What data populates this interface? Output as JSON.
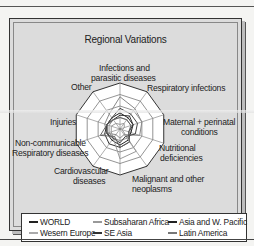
{
  "chart_data": {
    "type": "radar",
    "title": "Regional Variations",
    "axes": [
      "Infections and parasitic diseases",
      "Respiratory infections",
      "Maternal + perinatal conditions",
      "Nutritional deficiencies",
      "Malignant and other neoplasms",
      "Cardiovascular diseases",
      "Non-communicable Respiratory diseases",
      "Injuries",
      "Other"
    ],
    "grid_rings": 4,
    "grid": true,
    "legend_position": "bottom",
    "series": [
      {
        "name": "WORLD",
        "color": "#222222",
        "values": [
          0.35,
          0.3,
          0.3,
          0.25,
          0.3,
          0.35,
          0.3,
          0.3,
          0.3,
          0.3
        ],
        "values_are_estimates": true
      },
      {
        "name": "Subsaharan Africa",
        "color": "#888888",
        "values": [
          0.7,
          0.55,
          0.5,
          0.45,
          0.15,
          0.2,
          0.15,
          0.3,
          0.35,
          0.4
        ],
        "values_are_estimates": true
      },
      {
        "name": "Asia and W. Pacific",
        "color": "#333333",
        "values": [
          0.3,
          0.35,
          0.3,
          0.2,
          0.35,
          0.4,
          0.4,
          0.35,
          0.3,
          0.25
        ],
        "values_are_estimates": true
      },
      {
        "name": "Wesern Europe",
        "color": "#999999",
        "values": [
          0.1,
          0.15,
          0.1,
          0.05,
          0.6,
          0.65,
          0.25,
          0.2,
          0.2,
          0.15
        ],
        "values_are_estimates": true
      },
      {
        "name": "SE Asia",
        "color": "#444444",
        "values": [
          0.45,
          0.4,
          0.4,
          0.35,
          0.2,
          0.3,
          0.25,
          0.3,
          0.3,
          0.3
        ],
        "values_are_estimates": true
      },
      {
        "name": "Latin America",
        "color": "#666666",
        "values": [
          0.25,
          0.25,
          0.25,
          0.2,
          0.35,
          0.4,
          0.2,
          0.45,
          0.3,
          0.25
        ],
        "values_are_estimates": true
      }
    ]
  },
  "labels": {
    "infections_1": "Infections and",
    "infections_2": "parasitic diseases",
    "respiratory": "Respiratory infections",
    "maternal_1": "Maternal + perinatal",
    "maternal_2": "conditions",
    "nutritional_1": "Nutritional",
    "nutritional_2": "deficiencies",
    "malignant_1": "Malignant and other",
    "malignant_2": "neoplasms",
    "cardio_1": "Cardiovascular",
    "cardio_2": "diseases",
    "noncomm_1": "Non-communicable",
    "noncomm_2": "Respiratory diseases",
    "injuries": "Injuries",
    "other": "Other"
  },
  "legend": {
    "world": "WORLD",
    "subsaharan": "Subsaharan Africa",
    "asia": "Asia and W. Pacific",
    "europe": "Wesern Europe",
    "seasia": "SE Asia",
    "latam": "Latin America"
  }
}
